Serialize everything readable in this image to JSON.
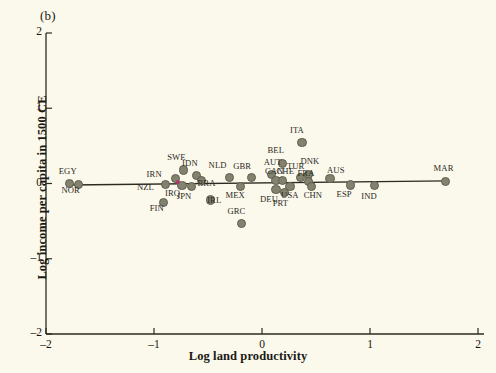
{
  "figure": {
    "panel_label": "(b)",
    "background_color": "#fbf8ec",
    "marker_color": "#82826f",
    "marker_edge_color": "#5e5e4e",
    "accent_color": "#b0386a",
    "line_color": "#2b2b20"
  },
  "chart_data": {
    "type": "scatter",
    "title": "(b)",
    "xlabel": "Log land productivity",
    "ylabel": "Log income per capita in 1500 CE",
    "xlim": [
      -2,
      2
    ],
    "ylim": [
      -2,
      2
    ],
    "xticks": [
      -2,
      -1,
      0,
      1,
      2
    ],
    "yticks": [
      -2,
      -1,
      0,
      1,
      2
    ],
    "xticklabels": [
      "-2",
      "-1",
      "0",
      "1",
      "2"
    ],
    "yticklabels": [
      "-2",
      "-1",
      "0",
      "1",
      "2"
    ],
    "grid": false,
    "legend": null,
    "fit_line": {
      "name": "linear fit",
      "x": [
        -1.78,
        1.72
      ],
      "y": [
        -0.02,
        0.035
      ],
      "slope": 0.016,
      "intercept": 0.007
    },
    "points": [
      {
        "label": "EGY",
        "x": -1.78,
        "y": 0.0,
        "label_dx": -2,
        "label_dy": -13
      },
      {
        "label": "NOR",
        "x": -1.7,
        "y": -0.01,
        "label_dx": -8,
        "label_dy": 6
      },
      {
        "label": "NZL",
        "x": -0.89,
        "y": -0.01,
        "label_dx": -20,
        "label_dy": 3
      },
      {
        "label": "FIN",
        "x": -0.91,
        "y": -0.25,
        "label_dx": -5,
        "label_dy": 6
      },
      {
        "label": "IRN",
        "x": -0.8,
        "y": 0.07,
        "label_dx": -20,
        "label_dy": -4
      },
      {
        "label": "SWE",
        "x": -0.73,
        "y": 0.18,
        "label_dx": -7,
        "label_dy": -13
      },
      {
        "label": "IRQ",
        "x": -0.74,
        "y": -0.03,
        "label_dx": -8,
        "label_dy": 7
      },
      {
        "label": "JPN",
        "x": -0.65,
        "y": -0.04,
        "label_dx": -6,
        "label_dy": 9
      },
      {
        "label": "IDN",
        "x": -0.61,
        "y": 0.11,
        "label_dx": -5,
        "label_dy": -12
      },
      {
        "label": "BRA",
        "x": -0.56,
        "y": 0.04,
        "label_dx": 5,
        "label_dy": 3
      },
      {
        "label": "IRL",
        "x": -0.48,
        "y": -0.22,
        "label_dx": 6,
        "label_dy": 0
      },
      {
        "label": "NLD",
        "x": -0.3,
        "y": 0.08,
        "label_dx": -12,
        "label_dy": -12
      },
      {
        "label": "MEX",
        "x": -0.2,
        "y": -0.04,
        "label_dx": -6,
        "label_dy": 8
      },
      {
        "label": "GBR",
        "x": -0.1,
        "y": 0.08,
        "label_dx": -9,
        "label_dy": -11
      },
      {
        "label": "GRC",
        "x": -0.19,
        "y": -0.53,
        "label_dx": -5,
        "label_dy": -12
      },
      {
        "label": "BEL",
        "x": 0.19,
        "y": 0.27,
        "label_dx": -6,
        "label_dy": -13
      },
      {
        "label": "AUT",
        "x": 0.09,
        "y": 0.12,
        "label_dx": 1,
        "label_dy": -12
      },
      {
        "label": "CAN",
        "x": 0.13,
        "y": 0.04,
        "label_dx": -2,
        "label_dy": -9
      },
      {
        "label": "CHE",
        "x": 0.19,
        "y": 0.04,
        "label_dx": 3,
        "label_dy": -9
      },
      {
        "label": "DEU",
        "x": 0.13,
        "y": -0.08,
        "label_dx": -7,
        "label_dy": 9
      },
      {
        "label": "PRT",
        "x": 0.21,
        "y": -0.12,
        "label_dx": -3,
        "label_dy": 10
      },
      {
        "label": "USA",
        "x": 0.26,
        "y": -0.04,
        "label_dx": 0,
        "label_dy": 8
      },
      {
        "label": "ITA",
        "x": 0.37,
        "y": 0.54,
        "label_dx": -3,
        "label_dy": -13
      },
      {
        "label": "TUR",
        "x": 0.36,
        "y": 0.08,
        "label_dx": -5,
        "label_dy": -11
      },
      {
        "label": "DNK",
        "x": 0.43,
        "y": 0.12,
        "label_dx": 1,
        "label_dy": -13
      },
      {
        "label": "FRA",
        "x": 0.43,
        "y": 0.03,
        "label_dx": -2,
        "label_dy": -8
      },
      {
        "label": "CHN",
        "x": 0.46,
        "y": -0.04,
        "label_dx": 1,
        "label_dy": 8
      },
      {
        "label": "AUS",
        "x": 0.63,
        "y": 0.07,
        "label_dx": 6,
        "label_dy": -8
      },
      {
        "label": "ESP",
        "x": 0.82,
        "y": -0.02,
        "label_dx": -5,
        "label_dy": 9
      },
      {
        "label": "IND",
        "x": 1.04,
        "y": -0.03,
        "label_dx": -4,
        "label_dy": 10
      },
      {
        "label": "MAR",
        "x": 1.7,
        "y": 0.03,
        "label_dx": -3,
        "label_dy": -13
      }
    ],
    "accent_marker": {
      "x": -0.78,
      "y": 0.02,
      "color": "#b0386a"
    }
  }
}
